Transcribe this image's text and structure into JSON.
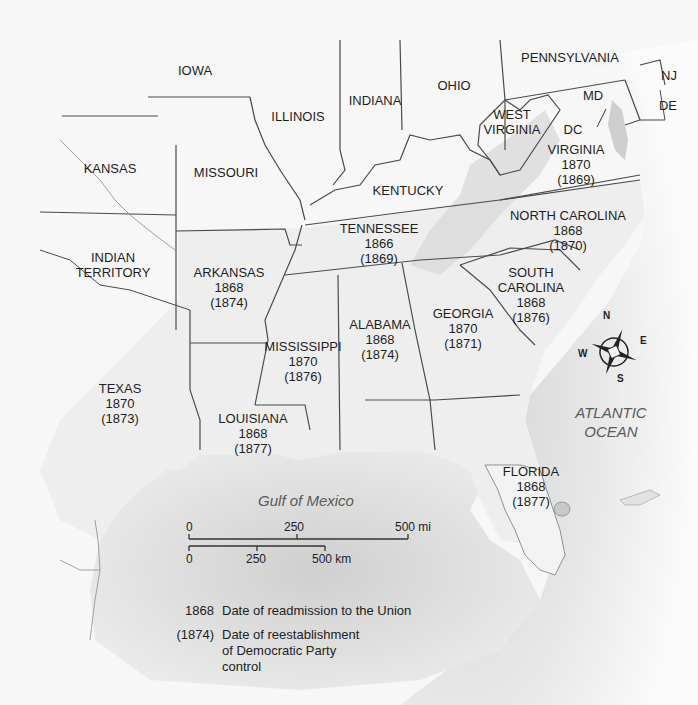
{
  "map": {
    "title": "Reconstruction in the South",
    "colors": {
      "land": "#f4f4f4",
      "land_shaded": "#e6e6e6",
      "ocean": "#d4d4d4",
      "border": "#4a4a4a",
      "river": "#8a8a8a",
      "text": "#1e1e1e",
      "water_text": "#5a5a5a"
    },
    "states": [
      {
        "id": "iowa",
        "name": "IOWA"
      },
      {
        "id": "illinois",
        "name": "ILLINOIS"
      },
      {
        "id": "indiana",
        "name": "INDIANA"
      },
      {
        "id": "ohio",
        "name": "OHIO"
      },
      {
        "id": "pennsylvania",
        "name": "PENNSYLVANIA"
      },
      {
        "id": "nj",
        "name": "NJ"
      },
      {
        "id": "de",
        "name": "DE"
      },
      {
        "id": "md",
        "name": "MD"
      },
      {
        "id": "dc",
        "name": "DC"
      },
      {
        "id": "west-virginia",
        "name": "WEST VIRGINIA"
      },
      {
        "id": "kansas",
        "name": "KANSAS"
      },
      {
        "id": "missouri",
        "name": "MISSOURI"
      },
      {
        "id": "kentucky",
        "name": "KENTUCKY"
      },
      {
        "id": "indian-territory",
        "name": "INDIAN TERRITORY"
      }
    ],
    "confederate_states": [
      {
        "id": "virginia",
        "name": "VIRGINIA",
        "readmitted": "1870",
        "democratic_control": "(1869)"
      },
      {
        "id": "north-carolina",
        "name": "NORTH CAROLINA",
        "readmitted": "1868",
        "democratic_control": "(1870)"
      },
      {
        "id": "tennessee",
        "name": "TENNESSEE",
        "readmitted": "1866",
        "democratic_control": "(1869)"
      },
      {
        "id": "arkansas",
        "name": "ARKANSAS",
        "readmitted": "1868",
        "democratic_control": "(1874)"
      },
      {
        "id": "south-carolina",
        "name": "SOUTH CAROLINA",
        "readmitted": "1868",
        "democratic_control": "(1876)"
      },
      {
        "id": "georgia",
        "name": "GEORGIA",
        "readmitted": "1870",
        "democratic_control": "(1871)"
      },
      {
        "id": "alabama",
        "name": "ALABAMA",
        "readmitted": "1868",
        "democratic_control": "(1874)"
      },
      {
        "id": "mississippi",
        "name": "MISSISSIPPI",
        "readmitted": "1870",
        "democratic_control": "(1876)"
      },
      {
        "id": "texas",
        "name": "TEXAS",
        "readmitted": "1870",
        "democratic_control": "(1873)"
      },
      {
        "id": "louisiana",
        "name": "LOUISIANA",
        "readmitted": "1868",
        "democratic_control": "(1877)"
      },
      {
        "id": "florida",
        "name": "FLORIDA",
        "readmitted": "1868",
        "democratic_control": "(1877)"
      }
    ],
    "water_bodies": {
      "atlantic_line1": "ATLANTIC",
      "atlantic_line2": "OCEAN",
      "gulf": "Gulf of Mexico"
    },
    "compass": {
      "n": "N",
      "e": "E",
      "s": "S",
      "w": "W"
    },
    "scale": {
      "mi_0": "0",
      "mi_250": "250",
      "mi_500": "500 mi",
      "km_0": "0",
      "km_250": "250",
      "km_500": "500 km"
    },
    "legend": [
      {
        "key": "1868",
        "description": "Date of readmission to the Union"
      },
      {
        "key": "(1874)",
        "description": "Date of reestablishment of Democratic Party control"
      }
    ]
  }
}
